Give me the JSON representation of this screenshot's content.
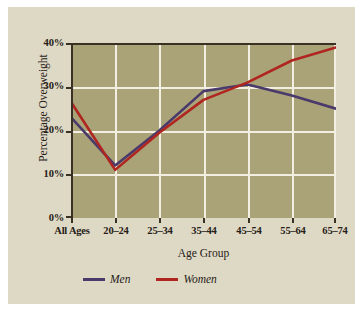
{
  "chart_data": {
    "type": "line",
    "title": "",
    "xlabel": "Age Group",
    "ylabel": "Percentage Overweight",
    "categories": [
      "All Ages",
      "20–24",
      "25–34",
      "35–44",
      "45–54",
      "55–64",
      "65–74"
    ],
    "ylim": [
      0,
      40
    ],
    "yticks": [
      0,
      10,
      20,
      30,
      40
    ],
    "ytick_labels": [
      "0%",
      "10%",
      "20%",
      "30%",
      "40%"
    ],
    "grid": "both",
    "legend_position": "bottom-left",
    "series": [
      {
        "name": "Men",
        "color": "#4a3a6b",
        "values": [
          23,
          12,
          20,
          29,
          30.5,
          28,
          25
        ]
      },
      {
        "name": "Women",
        "color": "#b02520",
        "values": [
          26.5,
          11,
          19.5,
          27,
          31,
          36,
          39
        ]
      }
    ]
  },
  "axes": {
    "ylabel": "Percentage Overweight",
    "xlabel": "Age Group"
  },
  "legend": {
    "items": [
      {
        "label": "Men",
        "color": "#4a3a6b"
      },
      {
        "label": "Women",
        "color": "#b02520"
      }
    ]
  },
  "colors": {
    "page_background": "#ffffff",
    "figure_background": "#ded9c5",
    "plot_background": "#a9a377",
    "gridline": "#f2efe2",
    "axis": "#3a3024",
    "text": "#262017",
    "men": "#4a3a6b",
    "women": "#b02520"
  }
}
